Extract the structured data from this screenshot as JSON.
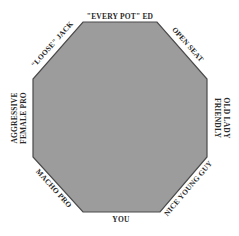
{
  "diagram": {
    "shape": "octagon",
    "fill_color": "#9c9c9c",
    "border_color": "#555555",
    "seats": [
      {
        "position": "top",
        "label": "\"EVERY POT\" ED"
      },
      {
        "position": "top-right",
        "label": "OPEN SEAT"
      },
      {
        "position": "right",
        "label_line1": "FRIENDLY",
        "label_line2": "OLD LADY"
      },
      {
        "position": "bottom-right",
        "label": "NICE YOUNG GUY"
      },
      {
        "position": "bottom",
        "label": "YOU"
      },
      {
        "position": "bottom-left",
        "label": "MACHO PRO"
      },
      {
        "position": "left",
        "label_line1": "AGGRESSIVE",
        "label_line2": "FEMALE PRO"
      },
      {
        "position": "top-left",
        "label": "\"LOOSE\" JACK"
      }
    ]
  }
}
